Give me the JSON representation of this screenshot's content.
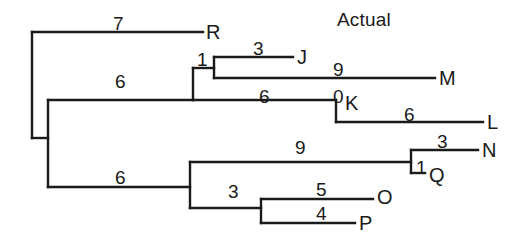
{
  "figure": {
    "title": "Actual",
    "kind": "phylogenetic-tree-cladogram",
    "line_color": "#1a1a1a",
    "text_color": "#1a1a1a",
    "background_color": "#ffffff"
  },
  "taxa": [
    {
      "id": "R",
      "label": "R",
      "x": 206,
      "y": 32
    },
    {
      "id": "J",
      "label": "J",
      "x": 297,
      "y": 57
    },
    {
      "id": "M",
      "label": "M",
      "x": 439,
      "y": 78
    },
    {
      "id": "K",
      "label": "K",
      "x": 345,
      "y": 103
    },
    {
      "id": "L",
      "label": "L",
      "x": 487,
      "y": 122
    },
    {
      "id": "N",
      "label": "N",
      "x": 482,
      "y": 150
    },
    {
      "id": "Q",
      "label": "Q",
      "x": 429,
      "y": 175
    },
    {
      "id": "O",
      "label": "O",
      "x": 377,
      "y": 197
    },
    {
      "id": "P",
      "label": "P",
      "x": 359,
      "y": 223
    }
  ],
  "branch_lengths": [
    {
      "id": "branch-R",
      "value": "7",
      "x": 113,
      "y": 14
    },
    {
      "id": "branch-upper-clade",
      "value": "6",
      "x": 115,
      "y": 72
    },
    {
      "id": "branch-node1",
      "value": "1",
      "x": 197,
      "y": 50
    },
    {
      "id": "branch-J",
      "value": "3",
      "x": 253,
      "y": 39
    },
    {
      "id": "branch-M",
      "value": "9",
      "x": 333,
      "y": 60
    },
    {
      "id": "branch-KL",
      "value": "6",
      "x": 259,
      "y": 87
    },
    {
      "id": "branch-K",
      "value": "0",
      "x": 333,
      "y": 87
    },
    {
      "id": "branch-L",
      "value": "6",
      "x": 404,
      "y": 105
    },
    {
      "id": "branch-lower-clade",
      "value": "6",
      "x": 115,
      "y": 168
    },
    {
      "id": "branch-NQ",
      "value": "9",
      "x": 295,
      "y": 138
    },
    {
      "id": "branch-N",
      "value": "3",
      "x": 437,
      "y": 132
    },
    {
      "id": "branch-node-NQ",
      "value": "1",
      "x": 416,
      "y": 158
    },
    {
      "id": "branch-OP",
      "value": "3",
      "x": 228,
      "y": 182
    },
    {
      "id": "branch-O",
      "value": "5",
      "x": 316,
      "y": 180
    },
    {
      "id": "branch-P",
      "value": "4",
      "x": 316,
      "y": 204
    }
  ],
  "edges": [
    {
      "id": "root-stem-vertical",
      "x1": 32,
      "y1": 32,
      "x2": 32,
      "y2": 138
    },
    {
      "id": "edge-R-horizontal",
      "x1": 32,
      "y1": 32,
      "x2": 203,
      "y2": 32
    },
    {
      "id": "edge-upper-clade-horizontal",
      "x1": 48,
      "y1": 100,
      "x2": 193,
      "y2": 100
    },
    {
      "id": "inner-stem-vertical",
      "x1": 48,
      "y1": 100,
      "x2": 48,
      "y2": 187
    },
    {
      "id": "root-to-inner-horizontal",
      "x1": 32,
      "y1": 138,
      "x2": 48,
      "y2": 138
    },
    {
      "id": "node1-vertical",
      "x1": 193,
      "y1": 68,
      "x2": 193,
      "y2": 100
    },
    {
      "id": "edge-JM-horizontal",
      "x1": 193,
      "y1": 68,
      "x2": 214,
      "y2": 68
    },
    {
      "id": "node-JM-vertical",
      "x1": 214,
      "y1": 57,
      "x2": 214,
      "y2": 78
    },
    {
      "id": "edge-J-horizontal",
      "x1": 214,
      "y1": 57,
      "x2": 293,
      "y2": 57
    },
    {
      "id": "edge-M-horizontal",
      "x1": 214,
      "y1": 78,
      "x2": 435,
      "y2": 78
    },
    {
      "id": "edge-K-horizontal",
      "x1": 193,
      "y1": 100,
      "x2": 336,
      "y2": 100
    },
    {
      "id": "node-K-vertical",
      "x1": 336,
      "y1": 100,
      "x2": 336,
      "y2": 122
    },
    {
      "id": "edge-L-horizontal",
      "x1": 336,
      "y1": 122,
      "x2": 483,
      "y2": 122
    },
    {
      "id": "edge-lower-clade-horizontal",
      "x1": 48,
      "y1": 187,
      "x2": 190,
      "y2": 187
    },
    {
      "id": "node-lower-vertical",
      "x1": 190,
      "y1": 162,
      "x2": 190,
      "y2": 208
    },
    {
      "id": "edge-NQ-horizontal",
      "x1": 190,
      "y1": 162,
      "x2": 411,
      "y2": 162
    },
    {
      "id": "node-NQ-vertical",
      "x1": 411,
      "y1": 150,
      "x2": 411,
      "y2": 173
    },
    {
      "id": "edge-N-horizontal",
      "x1": 411,
      "y1": 150,
      "x2": 478,
      "y2": 150
    },
    {
      "id": "edge-Q-horizontal",
      "x1": 411,
      "y1": 173,
      "x2": 425,
      "y2": 173
    },
    {
      "id": "edge-OP-horizontal",
      "x1": 190,
      "y1": 208,
      "x2": 261,
      "y2": 208
    },
    {
      "id": "node-OP-vertical",
      "x1": 261,
      "y1": 199,
      "x2": 261,
      "y2": 223
    },
    {
      "id": "edge-O-horizontal",
      "x1": 261,
      "y1": 199,
      "x2": 373,
      "y2": 199
    },
    {
      "id": "edge-P-horizontal",
      "x1": 261,
      "y1": 223,
      "x2": 355,
      "y2": 223
    }
  ],
  "title_position": {
    "x": 337,
    "y": 10
  }
}
